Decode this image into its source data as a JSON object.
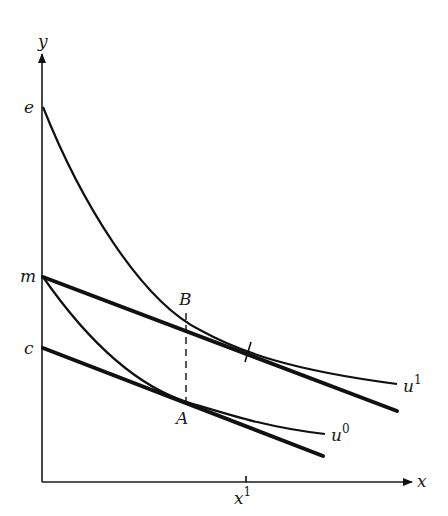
{
  "axes": {
    "x_label": "x",
    "y_label": "y"
  },
  "y_intercepts": {
    "e": "e",
    "m": "m",
    "c": "c"
  },
  "points": {
    "B": "B",
    "A": "A"
  },
  "curves": {
    "u1": {
      "base": "u",
      "sup": "1"
    },
    "u0": {
      "base": "u",
      "sup": "0"
    }
  },
  "x_tick": {
    "base": "x",
    "sup": "1"
  },
  "colors": {
    "ink": "#111111",
    "background": "#ffffff"
  }
}
